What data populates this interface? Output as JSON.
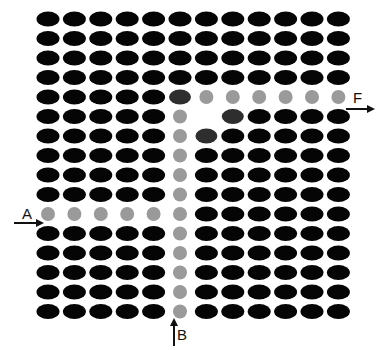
{
  "diagram": {
    "type": "lattice-defect-diagram",
    "grid": {
      "columns": 12,
      "rows": 16,
      "origin_x": 48,
      "origin_y": 19,
      "spacing_x": 26.4,
      "spacing_y": 19.5
    },
    "colors": {
      "background": "#ffffff",
      "atom_black": "#050505",
      "atom_dark": "#2e2e2e",
      "atom_gray": "#9a9a9a",
      "arrow": "#111111"
    },
    "atom_shapes": {
      "black": {
        "rx": 11.5,
        "ry": 7.5
      },
      "dark": {
        "rx": 11,
        "ry": 7.5
      },
      "gray": {
        "rx": 7,
        "ry": 7
      }
    },
    "special_atoms": [
      {
        "row": 4,
        "col": 5,
        "kind": "dark"
      },
      {
        "row": 4,
        "col": 6,
        "kind": "gray"
      },
      {
        "row": 4,
        "col": 7,
        "kind": "gray"
      },
      {
        "row": 4,
        "col": 8,
        "kind": "gray"
      },
      {
        "row": 4,
        "col": 9,
        "kind": "gray"
      },
      {
        "row": 4,
        "col": 10,
        "kind": "gray"
      },
      {
        "row": 4,
        "col": 11,
        "kind": "gray"
      },
      {
        "row": 5,
        "col": 5,
        "kind": "gray"
      },
      {
        "row": 5,
        "col": 6,
        "kind": "empty"
      },
      {
        "row": 5,
        "col": 7,
        "kind": "dark"
      },
      {
        "row": 6,
        "col": 5,
        "kind": "gray"
      },
      {
        "row": 6,
        "col": 6,
        "kind": "dark"
      },
      {
        "row": 7,
        "col": 5,
        "kind": "gray"
      },
      {
        "row": 8,
        "col": 5,
        "kind": "gray"
      },
      {
        "row": 9,
        "col": 5,
        "kind": "gray"
      },
      {
        "row": 10,
        "col": 0,
        "kind": "gray"
      },
      {
        "row": 10,
        "col": 1,
        "kind": "gray"
      },
      {
        "row": 10,
        "col": 2,
        "kind": "gray"
      },
      {
        "row": 10,
        "col": 3,
        "kind": "gray"
      },
      {
        "row": 10,
        "col": 4,
        "kind": "gray"
      },
      {
        "row": 10,
        "col": 5,
        "kind": "gray"
      },
      {
        "row": 11,
        "col": 5,
        "kind": "gray"
      },
      {
        "row": 12,
        "col": 5,
        "kind": "gray"
      },
      {
        "row": 13,
        "col": 5,
        "kind": "gray"
      },
      {
        "row": 14,
        "col": 5,
        "kind": "gray"
      },
      {
        "row": 15,
        "col": 5,
        "kind": "gray"
      }
    ],
    "labels": {
      "a": {
        "text": "A",
        "x": 22,
        "y": 219
      },
      "f": {
        "text": "F",
        "x": 353,
        "y": 103
      },
      "b": {
        "text": "B",
        "x": 177,
        "y": 340
      }
    },
    "arrows": [
      {
        "name": "arrow-a",
        "x1": 14,
        "y1": 223,
        "x2": 42,
        "y2": 223,
        "direction": "right"
      },
      {
        "name": "arrow-f",
        "x1": 346,
        "y1": 109,
        "x2": 373,
        "y2": 109,
        "direction": "right"
      },
      {
        "name": "arrow-b",
        "x1": 174,
        "y1": 346,
        "x2": 174,
        "y2": 320,
        "direction": "up"
      }
    ]
  }
}
